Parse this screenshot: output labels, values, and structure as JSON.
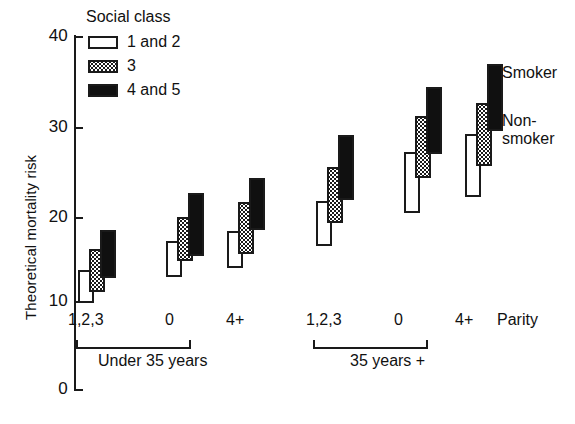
{
  "chart_data": {
    "type": "bar",
    "subtype": "floating-range-bars",
    "title": "",
    "xlabel": "Parity",
    "ylabel": "Theoretical mortality risk",
    "ylim": [
      0,
      40
    ],
    "yticks": [
      0,
      10,
      20,
      30,
      40
    ],
    "ytick_labels": [
      "0",
      "10",
      "20",
      "30",
      "40"
    ],
    "grid": false,
    "legend": {
      "title": "Social class",
      "position": "top-left-inside",
      "entries": [
        {
          "key": "sc12",
          "label": "1 and 2",
          "fill": "white"
        },
        {
          "key": "sc3",
          "label": "3",
          "fill": "stippled"
        },
        {
          "key": "sc45",
          "label": "4 and 5",
          "fill": "black"
        }
      ]
    },
    "annotations": [
      {
        "name": "smoker-annotation",
        "text": "Smoker"
      },
      {
        "name": "nonsmoker-annotation",
        "line1": "Non-",
        "line2": "smoker"
      }
    ],
    "note": "Each bar spans from the non-smoker risk (bottom) to the smoker risk (top).",
    "age_groups": [
      {
        "label": "Under 35 years",
        "categories": [
          "1,2,3",
          "0",
          "4+"
        ],
        "clusters": [
          {
            "parity": "1,2,3",
            "bars": [
              {
                "series": "1 and 2",
                "nonsmoker": 9.8,
                "smoker": 13.6
              },
              {
                "series": "3",
                "nonsmoker": 11.1,
                "smoker": 15.9
              },
              {
                "series": "4 and 5",
                "nonsmoker": 12.6,
                "smoker": 18.1
              }
            ]
          },
          {
            "parity": "0",
            "bars": [
              {
                "series": "1 and 2",
                "nonsmoker": 12.8,
                "smoker": 16.8
              },
              {
                "series": "3",
                "nonsmoker": 14.6,
                "smoker": 19.5
              },
              {
                "series": "4 and 5",
                "nonsmoker": 15.1,
                "smoker": 22.3
              }
            ]
          },
          {
            "parity": "4+",
            "bars": [
              {
                "series": "1 and 2",
                "nonsmoker": 13.8,
                "smoker": 18.0
              },
              {
                "series": "3",
                "nonsmoker": 15.4,
                "smoker": 21.2
              },
              {
                "series": "4 and 5",
                "nonsmoker": 18.1,
                "smoker": 24.0
              }
            ]
          }
        ]
      },
      {
        "label": "35 years +",
        "categories": [
          "1,2,3",
          "0",
          "4+"
        ],
        "clusters": [
          {
            "parity": "1,2,3",
            "bars": [
              {
                "series": "1 and 2",
                "nonsmoker": 16.3,
                "smoker": 21.4
              },
              {
                "series": "3",
                "nonsmoker": 18.9,
                "smoker": 25.2
              },
              {
                "series": "4 and 5",
                "nonsmoker": 21.5,
                "smoker": 28.8
              }
            ]
          },
          {
            "parity": "0",
            "bars": [
              {
                "series": "1 and 2",
                "nonsmoker": 20.0,
                "smoker": 26.9
              },
              {
                "series": "3",
                "nonsmoker": 23.9,
                "smoker": 31.0
              },
              {
                "series": "4 and 5",
                "nonsmoker": 26.7,
                "smoker": 34.2
              }
            ]
          },
          {
            "parity": "4+",
            "bars": [
              {
                "series": "1 and 2",
                "nonsmoker": 21.8,
                "smoker": 28.9
              },
              {
                "series": "3",
                "nonsmoker": 25.3,
                "smoker": 32.4
              },
              {
                "series": "4 and 5",
                "nonsmoker": 29.3,
                "smoker": 36.8
              }
            ]
          }
        ]
      }
    ],
    "colors": {
      "axis": "#1a1a1a",
      "sc12": "#ffffff",
      "sc3": "#9a9a9a",
      "sc45": "#101010"
    }
  }
}
